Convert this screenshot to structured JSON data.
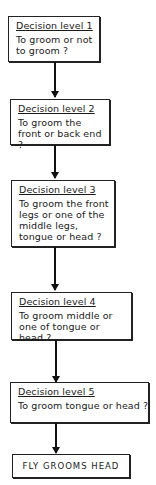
{
  "diagram": {
    "type": "flowchart",
    "direction": "top-to-bottom",
    "nodes": [
      {
        "id": "level1",
        "title": "Decision level  1",
        "question": "To groom or not to groom ?"
      },
      {
        "id": "level2",
        "title": "Decision level 2",
        "question": "To groom the front or back end ?"
      },
      {
        "id": "level3",
        "title": "Decision level  3",
        "question": "To groom the front legs or one of the middle legs, tongue or head ?"
      },
      {
        "id": "level4",
        "title": "Decision level  4",
        "question": "To groom middle or one of tongue or head ?"
      },
      {
        "id": "level5",
        "title": "Decision level  5",
        "question": "To groom tongue or head ?"
      },
      {
        "id": "outcome",
        "label": "FLY  GROOMS  HEAD"
      }
    ],
    "edges": [
      {
        "from": "level1",
        "to": "level2"
      },
      {
        "from": "level2",
        "to": "level3"
      },
      {
        "from": "level3",
        "to": "level4"
      },
      {
        "from": "level4",
        "to": "level5"
      },
      {
        "from": "level5",
        "to": "outcome"
      }
    ]
  }
}
